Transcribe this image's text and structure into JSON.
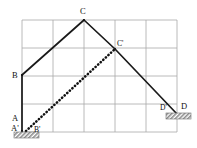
{
  "figure": {
    "background_color": "#ffffff",
    "grid": {
      "color": "#a8a8a8",
      "columns": 5,
      "rows": 4,
      "left": 22,
      "top": 20,
      "right": 177,
      "bottom": 132,
      "cell_width": 31,
      "cell_height": 28
    },
    "colors": {
      "member": "#1a1a1a",
      "grid": "#a8a8a8",
      "hatch": "#9a9a9a"
    },
    "labels": [
      {
        "name": "label-A",
        "text": "A",
        "x": 12,
        "y": 121,
        "size": "normal"
      },
      {
        "name": "label-Ap",
        "text": "A'",
        "x": 11,
        "y": 131,
        "size": "normal"
      },
      {
        "name": "label-B",
        "text": "B",
        "x": 12,
        "y": 78,
        "size": "normal"
      },
      {
        "name": "label-Bp",
        "text": "B'",
        "x": 34,
        "y": 132,
        "size": "small"
      },
      {
        "name": "label-C",
        "text": "C",
        "x": 80,
        "y": 14,
        "size": "normal"
      },
      {
        "name": "label-Cp",
        "text": "C'",
        "x": 117,
        "y": 46,
        "size": "small"
      },
      {
        "name": "label-Dp",
        "text": "D'",
        "x": 160,
        "y": 110,
        "size": "small"
      },
      {
        "name": "label-D",
        "text": "D",
        "x": 181,
        "y": 109,
        "size": "normal"
      }
    ],
    "solid_linkage": {
      "name": "solid-linkage-ABCD",
      "points": "22,131 22,75 84,20 115,49 177,114"
    },
    "dotted_linkage": {
      "name": "dotted-linkage-ABCprime",
      "points": "26,131 115,49"
    },
    "supports": [
      {
        "name": "support-hatch-left",
        "x": 14,
        "y": 132,
        "width": 25,
        "height": 6
      },
      {
        "name": "support-hatch-right",
        "x": 166,
        "y": 113,
        "width": 25,
        "height": 6
      }
    ],
    "vertices": [
      {
        "name": "vertex-A",
        "x": 22,
        "y": 131
      },
      {
        "name": "vertex-B",
        "x": 22,
        "y": 75
      },
      {
        "name": "vertex-C",
        "x": 84,
        "y": 20
      },
      {
        "name": "vertex-Cp",
        "x": 115,
        "y": 49
      },
      {
        "name": "vertex-D",
        "x": 177,
        "y": 114
      }
    ]
  }
}
